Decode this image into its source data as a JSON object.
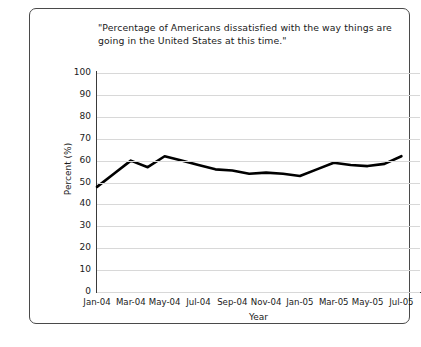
{
  "chart_data": {
    "type": "line",
    "title": "\"Percentage of Americans dissatisfied with the way things are going in the United States at this time.\"",
    "xlabel": "Year",
    "ylabel": "Percent (%)",
    "ylim": [
      0,
      100
    ],
    "ytick_step": 10,
    "yticks": [
      100,
      90,
      80,
      70,
      60,
      50,
      40,
      30,
      20,
      10,
      0
    ],
    "xticks": [
      "Jan-04",
      "Mar-04",
      "May-04",
      "Jul-04",
      "Sep-04",
      "Nov-04",
      "Jan-05",
      "Mar-05",
      "May-05",
      "Jul-05"
    ],
    "grid": "horizontal",
    "legend": "none",
    "line_color": "#000000",
    "line_width": 2.6,
    "grid_color": "#d8d8d8",
    "axis_color": "#3a3a3a",
    "x": [
      "Jan-04",
      "Feb-04",
      "Mar-04",
      "Apr-04",
      "May-04",
      "Jun-04",
      "Jul-04",
      "Aug-04",
      "Sep-04",
      "Oct-04",
      "Nov-04",
      "Dec-04",
      "Jan-05",
      "Feb-05",
      "Mar-05",
      "Apr-05",
      "May-05",
      "Jun-05",
      "Jul-05"
    ],
    "values": [
      48,
      54,
      60,
      57,
      62,
      60,
      58,
      56,
      55.5,
      54,
      54.5,
      54,
      53,
      56,
      59,
      58,
      57.5,
      58.5,
      62
    ]
  },
  "frame": {
    "border_color": "#4a4a4a",
    "background": "#ffffff"
  }
}
